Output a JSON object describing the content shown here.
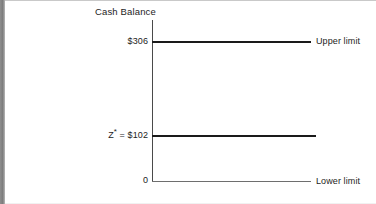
{
  "figure": {
    "title": "Cash Balance"
  },
  "axis": {
    "upper_tick": "$306",
    "target_tick": "Z",
    "target_tick_sup": "*",
    "target_tick_rest": " = $102",
    "zero_tick": "0"
  },
  "annotations": {
    "upper_limit": "Upper limit",
    "lower_limit": "Lower limit"
  },
  "chart_data": {
    "type": "line",
    "title": "Cash Balance",
    "xlabel": "",
    "ylabel": "Cash Balance",
    "ylim": [
      0,
      380
    ],
    "grid": false,
    "legend": "none",
    "x": [
      0,
      1
    ],
    "series": [
      {
        "name": "Upper limit",
        "value": 306,
        "label": "$306",
        "values": [
          306,
          306
        ],
        "style": "thick-solid",
        "color": "#1a1a1a",
        "annotation": "Upper limit"
      },
      {
        "name": "Z* (target cash balance)",
        "value": 102,
        "label": "Z* = $102",
        "values": [
          102,
          102
        ],
        "style": "thick-solid",
        "color": "#1a1a1a",
        "annotation": ""
      },
      {
        "name": "Lower limit",
        "value": 0,
        "label": "0",
        "values": [
          0,
          0
        ],
        "style": "thin-solid",
        "color": "#6e6e6e",
        "annotation": "Lower limit"
      }
    ],
    "ytick_labels": [
      "$306",
      "Z* = $102",
      "0"
    ],
    "ytick_values": [
      306,
      102,
      0
    ]
  }
}
